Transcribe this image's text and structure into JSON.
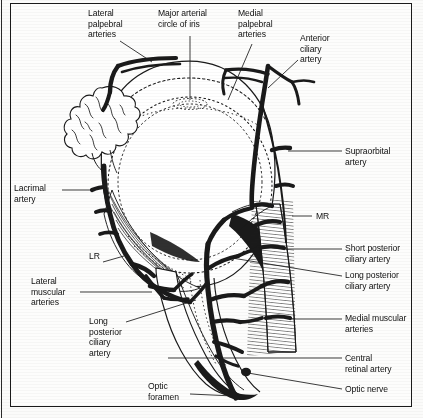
{
  "figure": {
    "background_color": "#fdfdfc",
    "ink_color": "#1a1a1a",
    "frame": {
      "border_color": "#1a1a1a"
    }
  },
  "labels": [
    {
      "id": "lateral-palpebral-arteries",
      "text": "Lateral\npalpebral\narteries",
      "x": 88,
      "y": 8
    },
    {
      "id": "major-arterial-circle-of-iris",
      "text": "Major arterial\ncircle of iris",
      "x": 158,
      "y": 8
    },
    {
      "id": "medial-palpebral-arteries",
      "text": "Medial\npalpebral\narteries",
      "x": 238,
      "y": 8
    },
    {
      "id": "anterior-ciliary-artery",
      "text": "Anterior\nciliary\nartery",
      "x": 300,
      "y": 33
    },
    {
      "id": "supraorbital-artery",
      "text": "Supraorbital\nartery",
      "x": 345,
      "y": 146
    },
    {
      "id": "mr",
      "text": "MR",
      "x": 316,
      "y": 211
    },
    {
      "id": "short-posterior-ciliary-artery",
      "text": "Short posterior\nciliary artery",
      "x": 345,
      "y": 243
    },
    {
      "id": "long-posterior-ciliary-artery",
      "text": "Long posterior\nciliary artery",
      "x": 345,
      "y": 270
    },
    {
      "id": "medial-muscular-arteries",
      "text": "Medial muscular\narteries",
      "x": 345,
      "y": 313
    },
    {
      "id": "central-retinal-artery",
      "text": "Central\nretinal artery",
      "x": 345,
      "y": 353
    },
    {
      "id": "optic-nerve",
      "text": "Optic nerve",
      "x": 345,
      "y": 386
    },
    {
      "id": "lacrimal-artery",
      "text": "Lacrimal\nartery",
      "x": 14,
      "y": 183
    },
    {
      "id": "lr",
      "text": "LR",
      "x": 89,
      "y": 257
    },
    {
      "id": "lateral-muscular-arteries",
      "text": "Lateral\nmuscular\narteries",
      "x": 31,
      "y": 276
    },
    {
      "id": "long-posterior-ciliary-artery-left",
      "text": "Long\nposterior\nciliary\nartery",
      "x": 89,
      "y": 321
    },
    {
      "id": "optic-foramen",
      "text": "Optic\nforamen",
      "x": 148,
      "y": 382
    }
  ],
  "leaders": [
    {
      "id": "leader-lateral-palpebral",
      "points": "120,41 152,62"
    },
    {
      "id": "leader-major-arterial-circle",
      "points": "190,34 190,91"
    },
    {
      "id": "leader-medial-palpebral",
      "points": "256,43 227,100"
    },
    {
      "id": "leader-anterior-ciliary",
      "points": "300,58 268,89"
    },
    {
      "id": "leader-supraorbital",
      "points": "343,151 283,151"
    },
    {
      "id": "leader-mr",
      "points": "313,216 290,216"
    },
    {
      "id": "leader-short-posterior-ciliary",
      "points": "343,249 283,249"
    },
    {
      "id": "leader-long-posterior-ciliary",
      "points": "343,276 231,258"
    },
    {
      "id": "leader-medial-muscular",
      "points": "343,319 281,319"
    },
    {
      "id": "leader-central-retinal",
      "points": "343,358 166,358"
    },
    {
      "id": "leader-optic-nerve",
      "points": "343,389 247,374"
    },
    {
      "id": "leader-lacrimal",
      "points": "62,190 92,190"
    },
    {
      "id": "leader-lr",
      "points": "104,262 124,262"
    },
    {
      "id": "leader-lateral-muscular",
      "points": "80,292 150,292"
    },
    {
      "id": "leader-long-posterior-left",
      "points": "125,323 192,303"
    },
    {
      "id": "leader-optic-foramen",
      "points": "191,394 235,394"
    }
  ],
  "structures": [
    {
      "id": "globe",
      "name": "eyeball-globe"
    },
    {
      "id": "lacrimal-gland",
      "name": "lacrimal-gland"
    },
    {
      "id": "optic-nerve-trunk",
      "name": "optic-nerve-trunk"
    },
    {
      "id": "medial-rectus",
      "name": "medial-rectus-muscle"
    },
    {
      "id": "lateral-rectus",
      "name": "lateral-rectus-muscle"
    },
    {
      "id": "ophthalmic-artery",
      "name": "ophthalmic-artery"
    }
  ]
}
